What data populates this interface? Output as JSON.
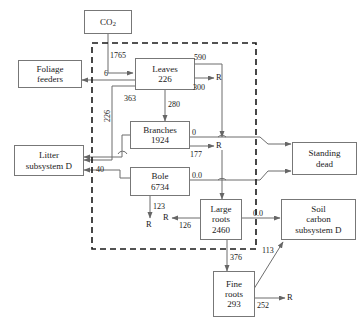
{
  "diagram": {
    "type": "flow-diagram",
    "units": "g C m-2 yr-1",
    "boundary": {
      "name": "tree-subsystem-boundary",
      "style": "dashed"
    },
    "colors": {
      "box_border": "#777777",
      "arrow": "#666666",
      "text": "#1a1a1a",
      "background": "#ffffff"
    }
  },
  "nodes": {
    "co2": {
      "name": "CO2",
      "label_main": "CO",
      "label_sub": "2",
      "value": ""
    },
    "foliage_feeders": {
      "line1": "Foliage",
      "line2": "feeders"
    },
    "leaves": {
      "line1": "Leaves",
      "line2": "226",
      "value": 226
    },
    "branches": {
      "line1": "Branches",
      "line2": "1924",
      "value": 1924
    },
    "bole": {
      "line1": "Bole",
      "line2": "6734",
      "value": 6734
    },
    "litter": {
      "line1": "Litter",
      "line2": "subsystem D"
    },
    "standing_dead": {
      "line1": "Standing",
      "line2": "dead"
    },
    "large_roots": {
      "line1": "Large",
      "line2": "roots",
      "line3": "2460",
      "value": 2460
    },
    "fine_roots": {
      "line1": "Fine",
      "line2": "roots",
      "line3": "293",
      "value": 293
    },
    "soil_carbon": {
      "line1": "Soil",
      "line2": "carbon",
      "line3": "subsystem D"
    }
  },
  "flows": [
    {
      "id": "co2-to-leaves",
      "label": "1765",
      "from": "co2",
      "to": "leaves"
    },
    {
      "id": "leaves-to-foliage-feeders",
      "label": "6",
      "from": "leaves",
      "to": "foliage_feeders"
    },
    {
      "id": "leaves-respiration-up",
      "label": "590",
      "from": "leaves",
      "to": "standing_dead"
    },
    {
      "id": "leaves-respiration",
      "label": "300",
      "from": "leaves",
      "to": "R"
    },
    {
      "id": "leaves-to-branches",
      "label": "280",
      "from": "leaves",
      "to": "branches"
    },
    {
      "id": "leaves-to-litter",
      "label": "226",
      "from": "leaves",
      "to": "litter"
    },
    {
      "id": "branches-to-litter",
      "label": "363",
      "from": "branches",
      "to": "litter"
    },
    {
      "id": "branches-out",
      "label": "0",
      "from": "branches",
      "to": "standing_dead"
    },
    {
      "id": "branches-respiration",
      "label": "177",
      "from": "branches",
      "to": "R"
    },
    {
      "id": "bole-to-litter",
      "label": "40",
      "from": "bole",
      "to": "litter"
    },
    {
      "id": "bole-out",
      "label": "0.0",
      "from": "bole",
      "to": "standing_dead"
    },
    {
      "id": "bole-respiration",
      "label": "123",
      "from": "bole",
      "to": "R"
    },
    {
      "id": "large-roots-respiration",
      "label": "126",
      "from": "large_roots",
      "to": "R"
    },
    {
      "id": "large-roots-to-soil",
      "label": "0.0",
      "from": "large_roots",
      "to": "soil_carbon"
    },
    {
      "id": "large-roots-to-fine-roots",
      "label": "376",
      "from": "large_roots",
      "to": "fine_roots"
    },
    {
      "id": "fine-roots-to-soil",
      "label": "113",
      "from": "fine_roots",
      "to": "soil_carbon"
    },
    {
      "id": "fine-roots-respiration",
      "label": "252",
      "from": "fine_roots",
      "to": "R"
    }
  ],
  "respiration_sinks": [
    {
      "id": "r-leaves",
      "label": "R"
    },
    {
      "id": "r-branches",
      "label": "R"
    },
    {
      "id": "r-bole",
      "label": "R"
    },
    {
      "id": "r-large-roots",
      "label": "R"
    },
    {
      "id": "r-fine-roots",
      "label": "R"
    }
  ],
  "labels": {
    "l_1765": "1765",
    "l_6": "6",
    "l_590": "590",
    "l_300": "300",
    "l_280": "280",
    "l_226": "226",
    "l_363": "363",
    "l_0_branches": "0",
    "l_177": "177",
    "l_40": "40",
    "l_0_bole": "0.0",
    "l_123": "123",
    "l_126": "126",
    "l_0_roots": "0.0",
    "l_376": "376",
    "l_113": "113",
    "l_252": "252",
    "r1": "R",
    "r2": "R",
    "r3": "R",
    "r4": "R",
    "r5": "R"
  }
}
